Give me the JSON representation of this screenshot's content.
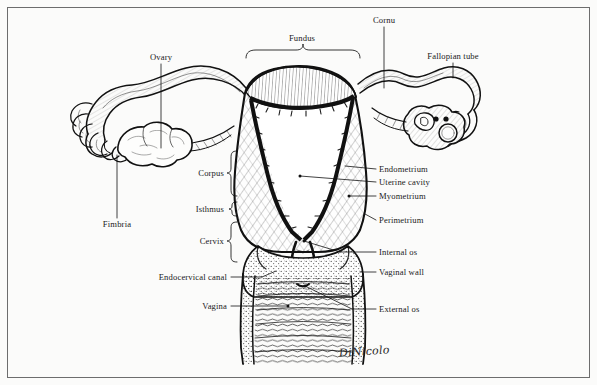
{
  "figure": {
    "signature": "DiNicolo",
    "background_color": "#fbfbfa",
    "ink_color": "#111111",
    "frame_color": "#6d6d6d"
  },
  "labels": {
    "fundus": "Fundus",
    "cornu": "Cornu",
    "ovary": "Ovary",
    "fallopian_tube": "Fallopian tube",
    "fimbria": "Fimbria",
    "corpus": "Corpus",
    "isthmus": "Isthmus",
    "cervix": "Cervix",
    "endocervical_canal": "Endocervical canal",
    "vagina": "Vagina",
    "endometrium": "Endometrium",
    "uterine_cavity": "Uterine cavity",
    "myometrium": "Myometrium",
    "perimetrium": "Perimetrium",
    "internal_os": "Internal os",
    "vaginal_wall": "Vaginal wall",
    "external_os": "External os"
  },
  "label_positions": {
    "fundus": {
      "x": 302,
      "y": 38,
      "align": "c"
    },
    "cornu": {
      "x": 384,
      "y": 20,
      "align": "c"
    },
    "ovary": {
      "x": 161,
      "y": 57,
      "align": "c"
    },
    "fallopian_tube": {
      "x": 453,
      "y": 56,
      "align": "c"
    },
    "fimbria": {
      "x": 117,
      "y": 224,
      "align": "c"
    },
    "corpus": {
      "x": 224,
      "y": 173,
      "align": "l"
    },
    "isthmus": {
      "x": 224,
      "y": 209,
      "align": "l"
    },
    "cervix": {
      "x": 224,
      "y": 241,
      "align": "l"
    },
    "endocervical_canal": {
      "x": 227,
      "y": 277,
      "align": "l"
    },
    "vagina": {
      "x": 227,
      "y": 306,
      "align": "l"
    },
    "endometrium": {
      "x": 379,
      "y": 169,
      "align": "r"
    },
    "uterine_cavity": {
      "x": 379,
      "y": 182,
      "align": "r"
    },
    "myometrium": {
      "x": 379,
      "y": 196,
      "align": "r"
    },
    "perimetrium": {
      "x": 379,
      "y": 220,
      "align": "r"
    },
    "internal_os": {
      "x": 379,
      "y": 252,
      "align": "r"
    },
    "vaginal_wall": {
      "x": 379,
      "y": 272,
      "align": "r"
    },
    "external_os": {
      "x": 379,
      "y": 309,
      "align": "r"
    }
  }
}
